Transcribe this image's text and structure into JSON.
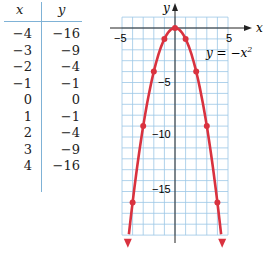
{
  "table": {
    "headers": [
      "x",
      "y"
    ],
    "rows": [
      [
        "−4",
        "−16"
      ],
      [
        "−3",
        "−9"
      ],
      [
        "−2",
        "−4"
      ],
      [
        "−1",
        "−1"
      ],
      [
        "0",
        "0"
      ],
      [
        "1",
        "−1"
      ],
      [
        "2",
        "−4"
      ],
      [
        "3",
        "−9"
      ],
      [
        "4",
        "−16"
      ]
    ]
  },
  "chart_data": {
    "type": "line",
    "title": "",
    "equation_label": "y = −x²",
    "xlabel": "x",
    "ylabel": "y",
    "x": [
      -4,
      -3,
      -2,
      -1,
      0,
      1,
      2,
      3,
      4
    ],
    "series": [
      {
        "name": "y = -x^2",
        "values": [
          -16,
          -9,
          -4,
          -1,
          0,
          -1,
          -4,
          -9,
          -16
        ]
      }
    ],
    "xlim": [
      -5,
      5
    ],
    "ylim": [
      -19,
      1
    ],
    "x_tick_labels": [
      "−5",
      "5"
    ],
    "y_tick_labels": [
      "−5",
      "−10",
      "−15"
    ],
    "grid": true,
    "colors": {
      "curve": "#d9323f",
      "grid": "#9cc7e6",
      "axis": "#222222"
    }
  },
  "labels": {
    "x_axis": "x",
    "y_axis": "y",
    "xneg5": "−5",
    "xpos5": "5",
    "yneg5": "−5",
    "yneg10": "−10",
    "yneg15": "−15",
    "eq_prefix": "y = −x",
    "eq_sup": "2"
  }
}
